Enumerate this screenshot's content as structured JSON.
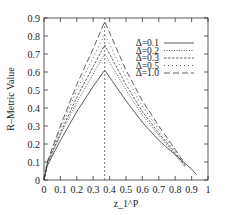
{
  "chart_data": {
    "type": "line",
    "title": "",
    "xlabel": "z_1^P",
    "ylabel": "R–Metric Value",
    "xlim": [
      0,
      1
    ],
    "ylim": [
      0,
      0.9
    ],
    "xticks": [
      "0",
      "0.1",
      "0.2",
      "0.3",
      "0.4",
      "0.5",
      "0.6",
      "0.7",
      "0.8",
      "0.9",
      "1"
    ],
    "yticks": [
      "0",
      "0.1",
      "0.2",
      "0.3",
      "0.4",
      "0.5",
      "0.6",
      "0.7",
      "0.8",
      "0.9"
    ],
    "grid": false,
    "legend_position": "upper right",
    "vertical_reference_line": {
      "x": 0.37,
      "style": "dashed"
    },
    "series": [
      {
        "name": "Δ=0.1",
        "style": "solid",
        "x": [
          0.0,
          0.02,
          0.1,
          0.2,
          0.3,
          0.37,
          0.5,
          0.6,
          0.7,
          0.8,
          0.9,
          0.93
        ],
        "y": [
          0.0,
          0.08,
          0.22,
          0.38,
          0.52,
          0.61,
          0.44,
          0.32,
          0.22,
          0.14,
          0.06,
          0.03
        ]
      },
      {
        "name": "Δ=0.2",
        "style": "dotted",
        "x": [
          0.0,
          0.02,
          0.1,
          0.2,
          0.3,
          0.37,
          0.5,
          0.6,
          0.7,
          0.8,
          0.86
        ],
        "y": [
          0.0,
          0.09,
          0.25,
          0.43,
          0.59,
          0.7,
          0.5,
          0.36,
          0.25,
          0.14,
          0.07
        ]
      },
      {
        "name": "Δ=0.3",
        "style": "dashed",
        "x": [
          0.0,
          0.02,
          0.1,
          0.2,
          0.3,
          0.37,
          0.5,
          0.6,
          0.7,
          0.8,
          0.86
        ],
        "y": [
          0.0,
          0.09,
          0.26,
          0.46,
          0.63,
          0.75,
          0.53,
          0.38,
          0.26,
          0.15,
          0.08
        ]
      },
      {
        "name": "Δ=0.5",
        "style": "sparse-dotted",
        "x": [
          0.0,
          0.02,
          0.1,
          0.2,
          0.3,
          0.37,
          0.5,
          0.6,
          0.7,
          0.8,
          0.86
        ],
        "y": [
          0.0,
          0.1,
          0.28,
          0.5,
          0.68,
          0.81,
          0.57,
          0.41,
          0.28,
          0.16,
          0.08
        ]
      },
      {
        "name": "Δ=1.0",
        "style": "long-dashed",
        "x": [
          0.0,
          0.02,
          0.1,
          0.2,
          0.3,
          0.37,
          0.5,
          0.6,
          0.7,
          0.8,
          0.86
        ],
        "y": [
          0.0,
          0.1,
          0.3,
          0.53,
          0.73,
          0.88,
          0.61,
          0.44,
          0.3,
          0.17,
          0.09
        ]
      }
    ]
  }
}
